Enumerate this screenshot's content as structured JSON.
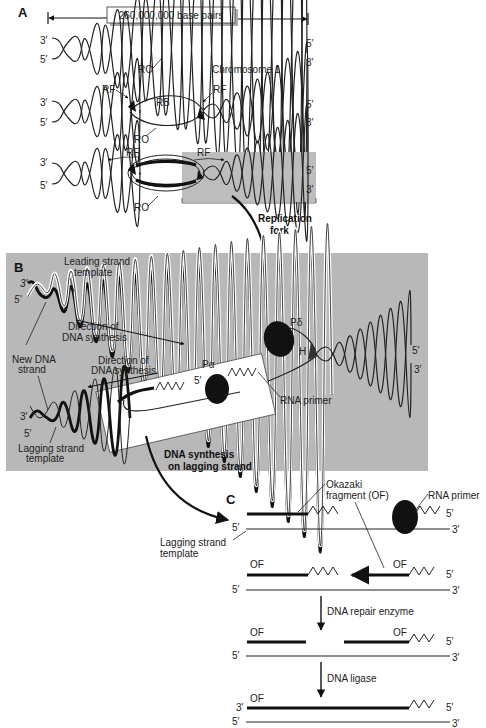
{
  "figure": {
    "panel_a": {
      "label": "A",
      "scale_label": "260,000,000  base pairs",
      "row1": {
        "left_top": "3′",
        "left_bottom": "5′",
        "right_top": "5′",
        "right_bottom": "3′",
        "origin": "RO",
        "chromosome": "Chromosome 1"
      },
      "row2": {
        "left_top": "3′",
        "left_bottom": "5′",
        "right_top": "5′",
        "right_bottom": "3′",
        "fork_left": "RF",
        "fork_right": "RF",
        "bubble": "RB",
        "origin": "RO"
      },
      "row3": {
        "left_top": "3′",
        "left_bottom": "5′",
        "right_top": "5′",
        "right_bottom": "3′",
        "fork_left": "RF",
        "fork_right": "RF",
        "origin": "RO"
      },
      "callout": "Replication fork"
    },
    "panel_b": {
      "label": "B",
      "leading_template": "Leading strand template",
      "dir_synthesis_1": "Direction of DNA synthesis",
      "dir_synthesis_2": "Direction of DNA synthesis",
      "new_strand": "New DNA strand",
      "lagging_template": "Lagging strand template",
      "pol_delta": "Pδ",
      "helicase": "H",
      "pol_alpha": "Pα",
      "five_prime_inner": "5′",
      "rna_primer": "RNA primer",
      "left_top": "3′",
      "left_bottom": "5′",
      "lag_left_top": "3′",
      "lag_left_bottom": "5′",
      "right_top": "5′",
      "right_bottom": "3′",
      "callout": "DNA synthesis on lagging strand"
    },
    "panel_c": {
      "label": "C",
      "okazaki": "Okazaki fragment (OF)",
      "rna_primer": "RNA primer",
      "lagging_template": "Lagging strand template",
      "step1": {
        "right_top": "5′",
        "left_bottom": "5′",
        "right_bottom": "3′"
      },
      "step2": {
        "of_left": "OF",
        "of_right": "OF",
        "right_top": "5′",
        "left_bottom": "5′",
        "right_bottom": "3′"
      },
      "enzyme1": "DNA repair enzyme",
      "step3": {
        "of_left": "OF",
        "of_right": "OF",
        "right_top": "5′",
        "left_bottom": "5′",
        "right_bottom": "3′"
      },
      "enzyme2": "DNA ligase",
      "step4": {
        "left_top": "3′",
        "of_left": "OF",
        "right_top": "5′",
        "left_bottom": "5′",
        "right_bottom": "3′"
      }
    },
    "colors": {
      "panel_b_bg": "#b8b8b8",
      "fork_box_bg": "#bdbdbd",
      "ink": "#111111"
    }
  }
}
